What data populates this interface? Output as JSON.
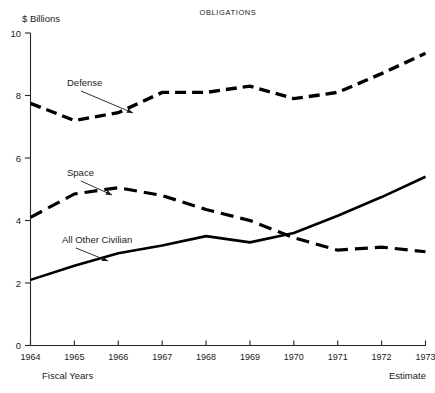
{
  "chart_data": {
    "type": "line",
    "title": "OBLIGATIONS",
    "ylabel": "$ Billions",
    "xlabel": "Fiscal Years",
    "x_note_right": "Estimate",
    "categories": [
      "1964",
      "1965",
      "1966",
      "1967",
      "1968",
      "1969",
      "1970",
      "1971",
      "1972",
      "1973"
    ],
    "x": [
      1964,
      1965,
      1966,
      1967,
      1968,
      1969,
      1970,
      1971,
      1972,
      1973
    ],
    "ylim": [
      0,
      10
    ],
    "xlim": [
      1964,
      1973
    ],
    "yticks": [
      "0",
      "2",
      "4",
      "6",
      "8",
      "10"
    ],
    "ytick_values": [
      0,
      2,
      4,
      6,
      8,
      10
    ],
    "grid": false,
    "legend": "inline-annotations",
    "series": [
      {
        "name": "Defense",
        "style": "dashed",
        "values": [
          7.75,
          7.2,
          7.45,
          8.1,
          8.1,
          8.3,
          7.9,
          8.1,
          8.7,
          9.35
        ]
      },
      {
        "name": "Space",
        "style": "dashed",
        "values": [
          4.1,
          4.85,
          5.05,
          4.8,
          4.35,
          4.0,
          3.45,
          3.05,
          3.15,
          3.0
        ]
      },
      {
        "name": "All Other Civilian",
        "style": "solid",
        "values": [
          2.1,
          2.55,
          2.95,
          3.2,
          3.5,
          3.3,
          3.6,
          4.15,
          4.75,
          5.4
        ]
      }
    ],
    "annotations": [
      {
        "label": "Defense",
        "text_x": 67,
        "text_y": 86,
        "arrow_to_x": 133,
        "arrow_to_y": 113
      },
      {
        "label": "Space",
        "text_x": 67,
        "text_y": 176,
        "arrow_to_x": 112,
        "arrow_to_y": 195
      },
      {
        "label": "All Other Civilian",
        "text_x": 62,
        "text_y": 243,
        "arrow_to_x": 108,
        "arrow_to_y": 261
      }
    ],
    "colors": {
      "ink": "#000000",
      "axis": "#262626",
      "background": "#ffffff"
    }
  }
}
